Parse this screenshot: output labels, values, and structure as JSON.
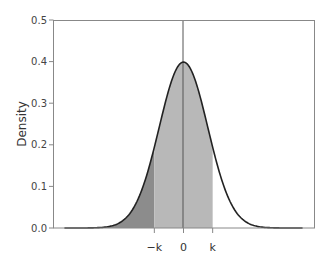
{
  "chart_data": {
    "type": "area",
    "title": "",
    "xlabel": "",
    "ylabel": "Density",
    "ylim": [
      0.0,
      0.5
    ],
    "yticks": [
      "0.0",
      "0.1",
      "0.2",
      "0.3",
      "0.4",
      "0.5"
    ],
    "xticks": [
      "−k",
      "0",
      "k"
    ],
    "xtick_values": [
      -1.2,
      0,
      1.2
    ],
    "xlim": [
      -5,
      5
    ],
    "grid": false,
    "legend": null,
    "series": [
      {
        "name": "standard normal density",
        "function": "normal_pdf",
        "mean": 0,
        "sd": 1,
        "peak": 0.4
      }
    ],
    "regions": [
      {
        "name": "left tail (x < -k)",
        "from": -5,
        "to": -1.2,
        "fill": "#8c8c8c"
      },
      {
        "name": "central (-k to k)",
        "from": -1.2,
        "to": 1.2,
        "fill": "#b8b8b8"
      },
      {
        "name": "right tail (x > k)",
        "from": 1.2,
        "to": 5,
        "fill": "#ffffff"
      }
    ],
    "annotations": [
      {
        "type": "vertical-line",
        "x": 0,
        "color": "#444444"
      }
    ]
  },
  "colors": {
    "curve": "#222222",
    "frame": "#888888",
    "left_tail_fill": "#8c8c8c",
    "center_fill": "#b8b8b8",
    "center_line": "#555555"
  }
}
